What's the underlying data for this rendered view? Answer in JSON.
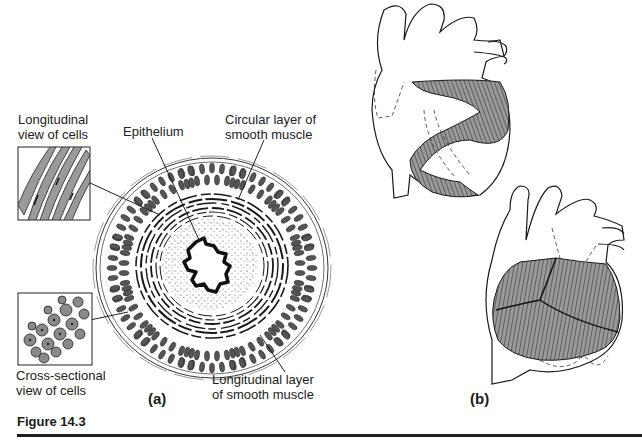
{
  "figure": {
    "caption": "Figure 14.3",
    "panels": [
      {
        "id": "a",
        "label": "(a)",
        "labels": {
          "longitudinal_view": [
            "Longitudinal",
            "view of cells"
          ],
          "epithelium": "Epithelium",
          "circular_layer": [
            "Circular layer of",
            "smooth muscle"
          ],
          "cross_sectional_view": [
            "Cross-sectional",
            "view of cells"
          ],
          "longitudinal_layer": [
            "Longitudinal layer",
            "of smooth muscle"
          ]
        }
      },
      {
        "id": "b",
        "label": "(b)"
      }
    ]
  },
  "colors": {
    "ink": "#1a1a1a",
    "muscle_fill": "#8a8a8a",
    "cell_fill": "#7a7a7a",
    "background": "#ffffff"
  }
}
